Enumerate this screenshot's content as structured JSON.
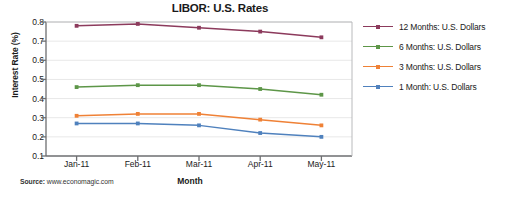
{
  "chart_data": {
    "type": "line",
    "title": "LIBOR: U.S. Rates",
    "xlabel": "Month",
    "ylabel": "Interest Rate (%)",
    "categories": [
      "Jan-11",
      "Feb-11",
      "Mar-11",
      "Apr-11",
      "May-11"
    ],
    "ylim": [
      0.1,
      0.8
    ],
    "yticks": [
      "0.8",
      "0.7",
      "0.6",
      "0.5",
      "0.4",
      "0.3",
      "0.2",
      "0.1"
    ],
    "ytick_values": [
      0.8,
      0.7,
      0.6,
      0.5,
      0.4,
      0.3,
      0.2,
      0.1
    ],
    "grid": true,
    "legend_position": "right",
    "series": [
      {
        "name": "12 Months: U.S. Dollars",
        "color": "#8c3a5c",
        "values": [
          0.78,
          0.79,
          0.77,
          0.75,
          0.72
        ]
      },
      {
        "name": "6 Months: U.S. Dollars",
        "color": "#5d9648",
        "values": [
          0.46,
          0.47,
          0.47,
          0.45,
          0.42
        ]
      },
      {
        "name": "3 Months: U.S. Dollars",
        "color": "#ef8136",
        "values": [
          0.31,
          0.32,
          0.32,
          0.29,
          0.26
        ]
      },
      {
        "name": "1 Month: U.S. Dollars",
        "color": "#4f81bd",
        "values": [
          0.27,
          0.27,
          0.26,
          0.22,
          0.2
        ]
      }
    ]
  },
  "source": {
    "label": "Source:",
    "text": " www.economagic.com"
  }
}
